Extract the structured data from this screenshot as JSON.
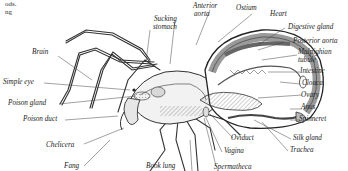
{
  "figure": {
    "top_left_fragment": [
      "ods.",
      "ng"
    ]
  },
  "labels": {
    "brain": "Brain",
    "simple_eye": "Simple eye",
    "poison_gland": "Poison gland",
    "poison_duct": "Poison duct",
    "chelicera": "Chelicera",
    "fang": "Fang",
    "sucking_stomach": [
      "Sucking",
      "stomach"
    ],
    "anterior_aorta": [
      "Anterior",
      "aorta"
    ],
    "ostium": "Ostium",
    "heart": "Heart",
    "digestive_gland": "Digestive gland",
    "posterior_aorta": "Posterior aorta",
    "malpighian_tubule": [
      "Malpighian",
      "tubule"
    ],
    "intestine": "Intestine",
    "cloaca": "Cloaca",
    "ovary": "Ovary",
    "anus": "Anus",
    "spinneret": "Spinneret",
    "silk_gland": "Silk gland",
    "trachea": "Trachea",
    "oviduct": "Oviduct",
    "vagina": "Vagina",
    "book_lung": "Book lung",
    "spermatheca": "Spermatheca"
  },
  "colors": {
    "ink": "#222222",
    "abdomen_tint": "#c8c8c8",
    "organ_dark": "#7a7a7a",
    "background": "#ffffff"
  }
}
